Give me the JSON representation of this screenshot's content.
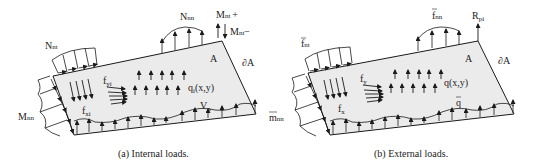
{
  "figure": {
    "panels": [
      {
        "id": "a",
        "caption": "(a)  Internal loads.",
        "region_label": "A",
        "boundary_label": "∂A",
        "labels": {
          "edge_shear_left": "N",
          "edge_shear_left_sub": "nt",
          "edge_normal_top": "N",
          "edge_normal_top_sub": "nn",
          "corner_moment_plus": "M",
          "corner_moment_plus_sub": "nt",
          "corner_moment_plus_sign": "+",
          "corner_moment_minus": "M",
          "corner_moment_minus_sub": "nt",
          "corner_moment_minus_sign": "−",
          "edge_moment_left": "M",
          "edge_moment_left_sub": "nn",
          "body_force_y": "f",
          "body_force_y_sub": "yi",
          "body_force_x": "f",
          "body_force_x_sub": "xi",
          "pressure": "q",
          "pressure_sub": "i",
          "pressure_args": "(x,y)",
          "edge_shear_bottom": "V",
          "edge_shear_bottom_sub": "n"
        }
      },
      {
        "id": "b",
        "caption": "(b)  External loads.",
        "region_label": "A",
        "boundary_label": "∂A",
        "labels": {
          "edge_shear_left": "f",
          "edge_shear_left_sub": "nt",
          "edge_normal_top": "f",
          "edge_normal_top_sub": "nn",
          "corner_force": "R",
          "corner_force_sub": "pi",
          "edge_moment_left": "m",
          "edge_moment_left_sub": "nn",
          "body_force_y": "f",
          "body_force_y_sub": "y",
          "body_force_x": "f",
          "body_force_x_sub": "x",
          "pressure": "q(x,y)",
          "edge_shear_bottom": "q"
        }
      }
    ],
    "colors": {
      "plate_fill": "#ebebeb",
      "line": "#1a1a1a",
      "text": "#222222"
    }
  }
}
